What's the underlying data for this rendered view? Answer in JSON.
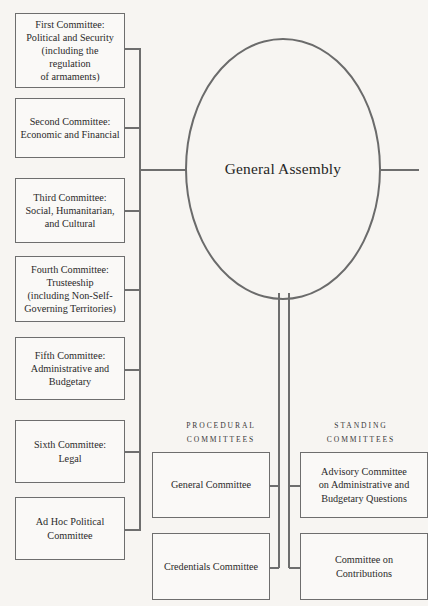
{
  "diagram": {
    "colors": {
      "background": "#f7f5f2",
      "stroke": "#6e6e6e",
      "node_fill": "#faf9f7",
      "text": "#2a2a2a"
    }
  },
  "center": {
    "label": "General Assembly"
  },
  "main_committees": [
    {
      "label": "First Committee:\nPolitical and Security\n(including the regulation\nof armaments)"
    },
    {
      "label": "Second Committee:\nEconomic and Financial"
    },
    {
      "label": "Third Committee:\nSocial, Humanitarian,\nand Cultural"
    },
    {
      "label": "Fourth Committee:\nTrusteeship\n(including Non-Self-\nGoverning Territories)"
    },
    {
      "label": "Fifth Committee:\nAdministrative and\nBudgetary"
    },
    {
      "label": "Sixth Committee:\nLegal"
    },
    {
      "label": "Ad Hoc Political\nCommittee"
    }
  ],
  "procedural": {
    "heading": "Procedural\nCommittees",
    "items": [
      {
        "label": "General Committee"
      },
      {
        "label": "Credentials Committee"
      }
    ]
  },
  "standing": {
    "heading": "Standing\nCommittees",
    "items": [
      {
        "label": "Advisory Committee\non Administrative and\nBudgetary Questions"
      },
      {
        "label": "Committee on\nContributions"
      }
    ]
  }
}
